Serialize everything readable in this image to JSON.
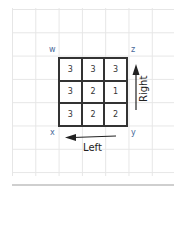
{
  "diagram": {
    "corners": {
      "top_left": "w",
      "top_right": "z",
      "bottom_left": "x",
      "bottom_right": "y"
    },
    "matrix": [
      [
        "3",
        "3",
        "3"
      ],
      [
        "3",
        "2",
        "1"
      ],
      [
        "3",
        "2",
        "2"
      ]
    ],
    "arrows": {
      "right": {
        "label": "Right",
        "direction": "up"
      },
      "left": {
        "label": "Left",
        "direction": "left"
      }
    },
    "colors": {
      "corner_label": "#4a6a9a",
      "grid_line": "#333333",
      "background_grid": "#e6e6e6"
    }
  }
}
